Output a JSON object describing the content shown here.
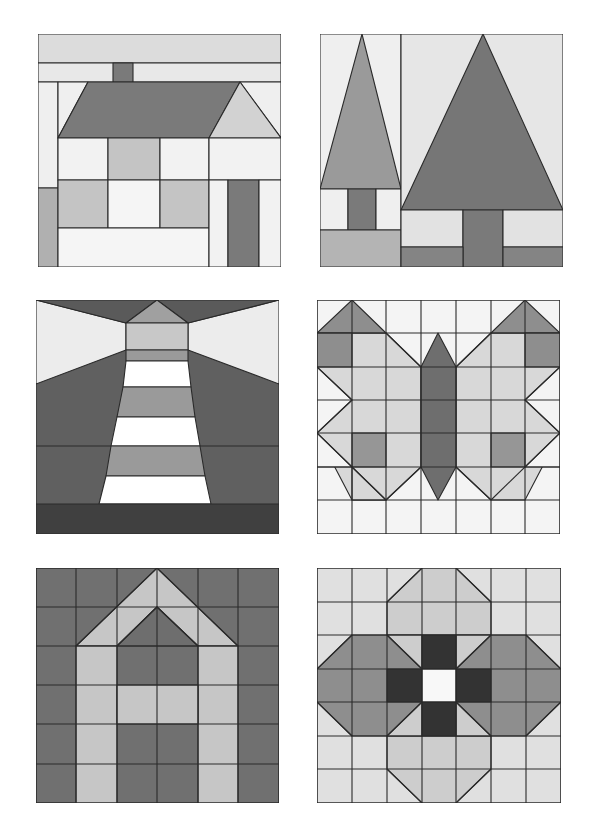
{
  "page": {
    "layout": {
      "rows": 3,
      "columns": 2
    }
  },
  "colors": {
    "white": "#ffffff",
    "very_light": "#ececec",
    "light": "#dcdcdc",
    "medium_light": "#c4c4c4",
    "medium": "#a8a8a8",
    "medium_dark": "#8a8a8a",
    "dark": "#707070",
    "very_dark": "#555555",
    "black": "#333333",
    "outline": "#2a2a2a"
  },
  "blocks": [
    {
      "id": "house",
      "label": "House block",
      "position": "row 1, column 1",
      "motif": "house with chimney, roof, windows and door"
    },
    {
      "id": "trees",
      "label": "Pine trees block",
      "position": "row 1, column 2",
      "motif": "small and large triangular pine trees with trunks"
    },
    {
      "id": "lighthouse",
      "label": "Lighthouse block",
      "position": "row 2, column 1",
      "motif": "striped lighthouse with light beams"
    },
    {
      "id": "butterfly",
      "label": "Butterfly block",
      "position": "row 2, column 2",
      "motif": "butterfly on a 7x7 grid"
    },
    {
      "id": "church",
      "label": "Arch / steeple block",
      "position": "row 3, column 1",
      "motif": "6x6 grid with pointed double arch"
    },
    {
      "id": "flower",
      "label": "Flower block",
      "position": "row 3, column 2",
      "motif": "7x7 grid flower with dark cross center and white center square"
    }
  ]
}
